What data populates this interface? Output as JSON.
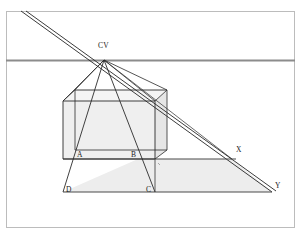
{
  "figure": {
    "type": "geometric-perspective-diagram",
    "background_color": "#ffffff",
    "frame": {
      "stroke": "#b8b8b8",
      "x": 6,
      "y": 11,
      "width": 289,
      "height": 217
    },
    "colors": {
      "horizon_line": "#8c8c8c",
      "construction_line": "#2b2b2b",
      "cube_face_fill": "#efefef",
      "cube_side_fill": "#e6e6e6",
      "ground_plane_fill": "#ededed",
      "label_text": "#1a1a1a"
    },
    "labels": [
      {
        "id": "cv",
        "text": "CV",
        "x": 103,
        "y": 47
      },
      {
        "id": "a",
        "text": "A",
        "x": 77,
        "y": 157
      },
      {
        "id": "b",
        "text": "B",
        "x": 131,
        "y": 157
      },
      {
        "id": "x",
        "text": "X",
        "x": 236,
        "y": 152
      },
      {
        "id": "y",
        "text": "Y",
        "x": 275,
        "y": 187
      },
      {
        "id": "d",
        "text": "D",
        "x": 67,
        "y": 192
      },
      {
        "id": "c",
        "text": "C",
        "x": 147,
        "y": 192
      }
    ],
    "points": {
      "CV": {
        "x": 104,
        "y": 60
      },
      "A": {
        "x": 84,
        "y": 159
      },
      "B": {
        "x": 138,
        "y": 159
      },
      "C": {
        "x": 155,
        "y": 192
      },
      "D": {
        "x": 63,
        "y": 192
      },
      "X": {
        "x": 232,
        "y": 159
      },
      "Y": {
        "x": 272,
        "y": 192
      }
    },
    "horizon_y": 60,
    "ground_line_y": 192,
    "measuring_line_y": 159
  }
}
